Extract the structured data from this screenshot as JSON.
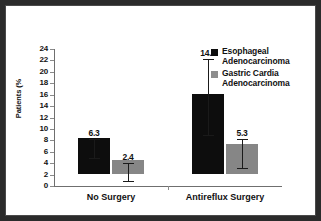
{
  "figure": {
    "border_color": "#2b2b2b",
    "background": "#ffffff"
  },
  "chart_data": {
    "type": "bar",
    "title": "",
    "subtitle": "",
    "xlabel": "",
    "ylabel": "Patients (%",
    "ylim": [
      0,
      24
    ],
    "yticks": [
      0,
      2,
      4,
      6,
      8,
      10,
      12,
      14,
      16,
      18,
      20,
      22,
      24
    ],
    "ytick_labels": [
      "0",
      "2",
      "4",
      "6",
      "8",
      "10",
      "12",
      "14",
      "16",
      "18",
      "20",
      "22",
      "24"
    ],
    "grid": false,
    "legend_position": "top-right",
    "categories": [
      "No Surgery",
      "Antireflux Surgery"
    ],
    "series": [
      {
        "name": "Esophageal Adenocarcinoma",
        "name_line1": "Esophageal",
        "name_line2": "Adenocarcinoma",
        "color": "#0d0d0d",
        "values": [
          6.3,
          14.1
        ],
        "value_labels": [
          "6.3",
          "14.1"
        ],
        "error_low": [
          4.9,
          8.9
        ],
        "error_high": [
          8.2,
          22.3
        ]
      },
      {
        "name": "Gastric Cardia Adenocarcinoma",
        "name_line1": "Gastric Cardia",
        "name_line2": "Adenocarcinoma",
        "color": "#868686",
        "values": [
          2.4,
          5.3
        ],
        "value_labels": [
          "2.4",
          "5.3"
        ],
        "error_low": [
          0.8,
          3.2
        ],
        "error_high": [
          4.0,
          8.2
        ]
      }
    ]
  },
  "legend": {
    "items": [
      {
        "label_line1": "Esophageal",
        "label_line2": "Adenocarcinoma",
        "color": "#0d0d0d"
      },
      {
        "label_line1": "Gastric Cardia",
        "label_line2": "Adenocarcinoma",
        "color": "#8e8e8e"
      }
    ]
  },
  "axis": {
    "y_title": "Patients (%",
    "x_categories": [
      "No Surgery",
      "Antireflux Surgery"
    ]
  }
}
